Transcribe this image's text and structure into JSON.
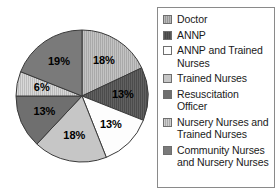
{
  "chart_data": {
    "type": "pie",
    "title": "",
    "subtitle": "",
    "xlabel": "",
    "ylabel": "",
    "legend_position": "right",
    "grid": false,
    "start_angle_deg": 0,
    "direction": "clockwise",
    "categories": [
      "Doctor",
      "ANNP",
      "ANNP and Trained Nurses",
      "Trained Nurses",
      "Resuscitation Officer",
      "Nursery Nurses and Trained Nurses",
      "Community Nurses and Nursery Nurses"
    ],
    "values": [
      18,
      13,
      13,
      18,
      13,
      6,
      19
    ],
    "data_labels": [
      "18%",
      "13%",
      "13%",
      "18%",
      "13%",
      "6%",
      "19%"
    ],
    "colors": [
      "#b9b9b9",
      "#585858",
      "#fdfdfd",
      "#c6c6c6",
      "#6f6f6f",
      "#cfcfcf",
      "#7a7a7a"
    ],
    "patterns": [
      "vertical-lines",
      "vertical-lines",
      "solid",
      "solid",
      "solid",
      "vertical-lines",
      "solid"
    ],
    "slices": [
      {
        "label": "Doctor",
        "value": 18,
        "data_label": "18%",
        "color": "#b9b9b9",
        "pattern": "vertical-lines"
      },
      {
        "label": "ANNP",
        "value": 13,
        "data_label": "13%",
        "color": "#585858",
        "pattern": "vertical-lines"
      },
      {
        "label": "ANNP and Trained Nurses",
        "value": 13,
        "data_label": "13%",
        "color": "#fdfdfd",
        "pattern": "solid"
      },
      {
        "label": "Trained Nurses",
        "value": 18,
        "data_label": "18%",
        "color": "#c6c6c6",
        "pattern": "solid"
      },
      {
        "label": "Resuscitation Officer",
        "value": 13,
        "data_label": "13%",
        "color": "#6f6f6f",
        "pattern": "solid"
      },
      {
        "label": "Nursery Nurses and Trained Nurses",
        "value": 6,
        "data_label": "6%",
        "color": "#cfcfcf",
        "pattern": "vertical-lines"
      },
      {
        "label": "Community Nurses and Nursery Nurses",
        "value": 19,
        "data_label": "19%",
        "color": "#7a7a7a",
        "pattern": "solid"
      }
    ]
  },
  "legend": {
    "items": [
      {
        "label": "Doctor",
        "color": "#b9b9b9",
        "pattern": "vertical-lines"
      },
      {
        "label": "ANNP",
        "color": "#585858",
        "pattern": "vertical-lines"
      },
      {
        "label": "ANNP and Trained Nurses",
        "color": "#fdfdfd",
        "pattern": "solid"
      },
      {
        "label": "Trained Nurses",
        "color": "#c6c6c6",
        "pattern": "solid"
      },
      {
        "label": "Resuscitation Officer",
        "color": "#6f6f6f",
        "pattern": "solid"
      },
      {
        "label": "Nursery Nurses and Trained Nurses",
        "color": "#cfcfcf",
        "pattern": "vertical-lines"
      },
      {
        "label": "Community Nurses and Nursery Nurses",
        "color": "#7a7a7a",
        "pattern": "solid"
      }
    ]
  },
  "style": {
    "outline_color": "#3a3a3a",
    "legend_border_color": "#8a8a8a",
    "label_color": "#000000"
  }
}
